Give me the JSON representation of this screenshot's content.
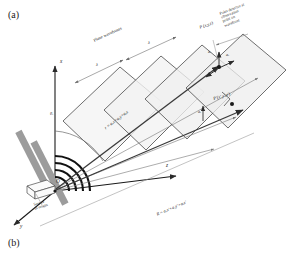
{
  "figure": {
    "panel_a_label": "(a)",
    "panel_b_label": "(b)",
    "background_color": "#ffffff",
    "ink_color": "#1a1a1a",
    "wavefront_fill": "#f2f2f2",
    "wavefront_stroke": "#555555",
    "source_block_color": "#9a9a9a",
    "vector_color": "#5c5c5c"
  },
  "axes": {
    "x_label": "x",
    "y_label": "y",
    "z_label": "z",
    "origin_label": "O"
  },
  "annotations": {
    "plane_wavefronts": "Plane wavefronts",
    "wavelength_1": "λ",
    "wavelength_2": "λ",
    "point_detector": "Point detector at observation point on wavefront",
    "point_detector_line1": "Point detector at",
    "point_detector_line2": "observation",
    "point_detector_line3": "point on",
    "point_detector_line4": "wavefront",
    "source_line1": "Source",
    "source_line2": "at origin",
    "theta_label": "θ",
    "theta_sub": "i",
    "point_P": "P (x,y,z)",
    "point_Pprime": "P'(x',y',z')",
    "r_vector_equation": "r = aₓx + aᵧy + aᶻ z",
    "R_vector_equation": "R = aₓx' + aᵧy' + aᶻ z'",
    "a_z_label": "a",
    "a_z_sub": "z",
    "a_y_label": "a",
    "a_y_sub": "y",
    "a_x_label": "a",
    "a_x_sub": "x"
  },
  "equations": {
    "r": {
      "lhs": "r",
      "eq": "=",
      "t1": "a",
      "t1s": "x",
      "t1v": "x",
      "plus1": "+",
      "t2": "a",
      "t2s": "y",
      "t2v": "y",
      "plus2": "+",
      "t3": "a",
      "t3s": "z",
      "t3v": "z"
    },
    "R": {
      "lhs": "R",
      "eq": "=",
      "t1": "a",
      "t1s": "x",
      "t1v": "x'",
      "plus1": "+",
      "t2": "a",
      "t2s": "y",
      "t2v": "y'",
      "plus2": "+",
      "t3": "a",
      "t3s": "z",
      "t3v": "z'"
    }
  }
}
